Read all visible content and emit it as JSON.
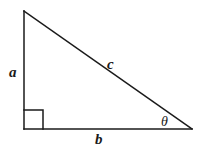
{
  "figure": {
    "kind": "right-triangle-diagram",
    "canvas": {
      "width": 201,
      "height": 156
    },
    "background_color": "#ffffff",
    "stroke_color": "#1a1a1a",
    "stroke_width": 1.5,
    "vertices": {
      "apex": {
        "x": 24,
        "y": 11
      },
      "right_angle": {
        "x": 24,
        "y": 129
      },
      "theta": {
        "x": 192,
        "y": 129
      }
    },
    "right_angle_marker": {
      "present": true,
      "size": 19,
      "x": 24,
      "y": 110
    },
    "labels": {
      "leg_vertical": "a",
      "hypotenuse": "c",
      "leg_horizontal": "b",
      "angle": "θ"
    },
    "label_positions": {
      "leg_vertical": {
        "x": 14,
        "y": 73
      },
      "hypotenuse": {
        "x": 113,
        "y": 65
      },
      "leg_horizontal": {
        "x": 100,
        "y": 140
      },
      "angle": {
        "x": 166,
        "y": 123
      }
    }
  }
}
